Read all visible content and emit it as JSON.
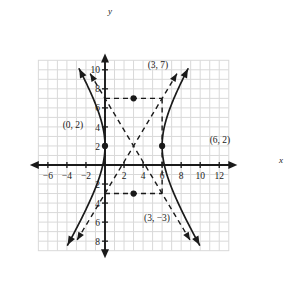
{
  "figure": {
    "title": "",
    "axis_labels": {
      "x": "x",
      "y": "y"
    },
    "x_ticks": [
      "-6",
      "-4",
      "-2",
      "2",
      "4",
      "6",
      "8",
      "10",
      "12"
    ],
    "y_ticks": [
      "10",
      "8",
      "6",
      "4",
      "2",
      "2",
      "4",
      "6",
      "8"
    ],
    "point_labels": {
      "p1": "(3, 7)",
      "p2": "(0, 2)",
      "p3": "(6, 2)",
      "p4": "(3, −3)"
    },
    "colors": {
      "grid": "#d9d9d9",
      "axis": "#1a1a1a",
      "curve": "#1a1a1a",
      "dashed": "#1a1a1a",
      "background": "#ffffff"
    }
  },
  "chart_data": {
    "type": "scatter",
    "title": "",
    "xlabel": "x",
    "ylabel": "y",
    "xlim": [
      -7,
      13
    ],
    "ylim": [
      -9,
      11
    ],
    "x_ticks": [
      -6,
      -4,
      -2,
      2,
      4,
      6,
      8,
      10,
      12
    ],
    "y_ticks": [
      10,
      8,
      6,
      4,
      2,
      -2,
      -4,
      -6,
      -8
    ],
    "grid": true,
    "legend": "none",
    "annotations": [
      {
        "label": "(3, 7)",
        "x": 3,
        "y": 7
      },
      {
        "label": "(0, 2)",
        "x": 0,
        "y": 2
      },
      {
        "label": "(6, 2)",
        "x": 6,
        "y": 2
      },
      {
        "label": "(3, −3)",
        "x": 3,
        "y": -3
      }
    ],
    "plotted_points": [
      {
        "x": 3,
        "y": 7
      },
      {
        "x": 0,
        "y": 2
      },
      {
        "x": 6,
        "y": 2
      },
      {
        "x": 3,
        "y": -3
      }
    ],
    "series": [
      {
        "name": "hyperbola",
        "kind": "conic-hyperbola",
        "orientation": "horizontal",
        "center": [
          3,
          2
        ],
        "a": 3,
        "b": 5,
        "vertices": [
          [
            0,
            2
          ],
          [
            6,
            2
          ]
        ],
        "equation": "(x-3)^2/9 - (y-2)^2/25 = 1"
      },
      {
        "name": "asymptote-positive",
        "kind": "line-dashed",
        "slope": 1.6667,
        "through": [
          3,
          2
        ]
      },
      {
        "name": "asymptote-negative",
        "kind": "line-dashed",
        "slope": -1.6667,
        "through": [
          3,
          2
        ]
      },
      {
        "name": "central-rectangle",
        "kind": "rect-dashed",
        "x_range": [
          0,
          6
        ],
        "y_range": [
          -3,
          7
        ]
      }
    ]
  }
}
